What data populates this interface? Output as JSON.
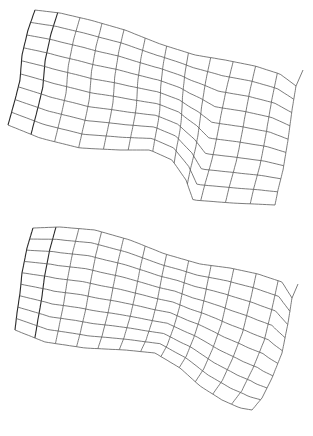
{
  "figure": {
    "line_color": "#5a5a5a",
    "background": "#ffffff"
  },
  "meshes": [
    {
      "name": "upper-mesh",
      "top": 0,
      "height": 215,
      "cols": 12,
      "rows": 9,
      "edges": {
        "top": [
          [
            35,
            10
          ],
          [
            60,
            13
          ],
          [
            90,
            20
          ],
          [
            125,
            30
          ],
          [
            160,
            44
          ],
          [
            195,
            55
          ],
          [
            225,
            60
          ],
          [
            255,
            66
          ],
          [
            280,
            74
          ],
          [
            296,
            86
          ]
        ],
        "bottom": [
          [
            8,
            125
          ],
          [
            40,
            138
          ],
          [
            80,
            148
          ],
          [
            120,
            150
          ],
          [
            150,
            150
          ],
          [
            172,
            160
          ],
          [
            186,
            180
          ],
          [
            193,
            200
          ],
          [
            232,
            203
          ],
          [
            275,
            205
          ]
        ],
        "left": [
          [
            35,
            10
          ],
          [
            28,
            30
          ],
          [
            22,
            55
          ],
          [
            20,
            80
          ],
          [
            15,
            100
          ],
          [
            8,
            125
          ]
        ],
        "right": [
          [
            296,
            86
          ],
          [
            292,
            110
          ],
          [
            288,
            140
          ],
          [
            283,
            170
          ],
          [
            278,
            190
          ],
          [
            275,
            205
          ]
        ]
      },
      "tail": [
        [
          296,
          86
        ],
        [
          303,
          70
        ]
      ],
      "fold_column": 1
    },
    {
      "name": "lower-mesh",
      "top": 218,
      "height": 218,
      "cols": 12,
      "rows": 9,
      "edges": {
        "top": [
          [
            33,
            10
          ],
          [
            60,
            9
          ],
          [
            95,
            12
          ],
          [
            130,
            22
          ],
          [
            165,
            36
          ],
          [
            200,
            46
          ],
          [
            230,
            50
          ],
          [
            258,
            56
          ],
          [
            282,
            64
          ],
          [
            292,
            80
          ]
        ],
        "bottom": [
          [
            15,
            112
          ],
          [
            45,
            124
          ],
          [
            85,
            130
          ],
          [
            125,
            132
          ],
          [
            155,
            135
          ],
          [
            180,
            150
          ],
          [
            200,
            168
          ],
          [
            222,
            182
          ],
          [
            240,
            190
          ],
          [
            252,
            192
          ]
        ],
        "left": [
          [
            33,
            10
          ],
          [
            27,
            30
          ],
          [
            22,
            55
          ],
          [
            20,
            75
          ],
          [
            17,
            95
          ],
          [
            15,
            112
          ]
        ],
        "right": [
          [
            292,
            80
          ],
          [
            288,
            105
          ],
          [
            282,
            135
          ],
          [
            272,
            160
          ],
          [
            262,
            180
          ],
          [
            252,
            192
          ]
        ]
      },
      "tail": [
        [
          292,
          80
        ],
        [
          298,
          66
        ]
      ],
      "fold_column": 1
    }
  ]
}
